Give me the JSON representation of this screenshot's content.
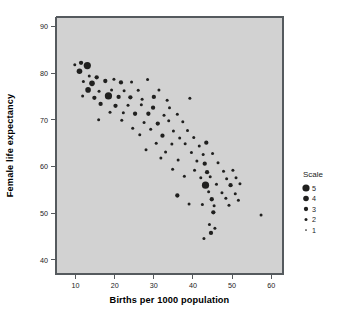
{
  "chart_data": {
    "type": "scatter",
    "title": "",
    "xlabel": "Births per 1000 population",
    "ylabel": "Female life expectancy",
    "xlim": [
      5,
      63
    ],
    "ylim": [
      37,
      92
    ],
    "xticks": [
      10,
      20,
      30,
      40,
      50,
      60
    ],
    "yticks": [
      40,
      50,
      60,
      70,
      80,
      90
    ],
    "xtick_labels": [
      "10",
      "20",
      "30",
      "40",
      "50",
      "60"
    ],
    "ytick_labels": [
      "40",
      "50",
      "60",
      "70",
      "80",
      "90"
    ],
    "grid": false,
    "legend": {
      "title": "Scale",
      "position": "right",
      "entries": [
        {
          "label": "5",
          "size": 5
        },
        {
          "label": "4",
          "size": 4
        },
        {
          "label": "3",
          "size": 3
        },
        {
          "label": "2",
          "size": 2
        },
        {
          "label": "1",
          "size": 1
        }
      ]
    },
    "size_encoding": "Scale",
    "point_color": "#20201f",
    "plot_background": "#d2d2d2",
    "points": [
      {
        "x": 9.8,
        "y": 81.8,
        "s": 2
      },
      {
        "x": 11.4,
        "y": 82.2,
        "s": 3
      },
      {
        "x": 13.0,
        "y": 81.6,
        "s": 5
      },
      {
        "x": 11.0,
        "y": 80.4,
        "s": 4
      },
      {
        "x": 13.5,
        "y": 79.4,
        "s": 2
      },
      {
        "x": 15.4,
        "y": 79.1,
        "s": 3
      },
      {
        "x": 12.0,
        "y": 78.2,
        "s": 2
      },
      {
        "x": 14.2,
        "y": 77.8,
        "s": 4
      },
      {
        "x": 17.6,
        "y": 78.3,
        "s": 3
      },
      {
        "x": 19.8,
        "y": 78.7,
        "s": 2
      },
      {
        "x": 21.6,
        "y": 78.0,
        "s": 3
      },
      {
        "x": 24.3,
        "y": 78.1,
        "s": 2
      },
      {
        "x": 28.4,
        "y": 78.6,
        "s": 2
      },
      {
        "x": 13.2,
        "y": 76.4,
        "s": 4
      },
      {
        "x": 16.0,
        "y": 76.1,
        "s": 2
      },
      {
        "x": 19.2,
        "y": 76.4,
        "s": 2
      },
      {
        "x": 22.4,
        "y": 76.2,
        "s": 2
      },
      {
        "x": 26.0,
        "y": 76.3,
        "s": 2
      },
      {
        "x": 31.3,
        "y": 76.4,
        "s": 2
      },
      {
        "x": 11.8,
        "y": 75.1,
        "s": 2
      },
      {
        "x": 14.8,
        "y": 74.7,
        "s": 3
      },
      {
        "x": 18.4,
        "y": 75.1,
        "s": 5
      },
      {
        "x": 21.0,
        "y": 74.9,
        "s": 3
      },
      {
        "x": 24.0,
        "y": 74.8,
        "s": 3
      },
      {
        "x": 27.0,
        "y": 74.4,
        "s": 2
      },
      {
        "x": 30.0,
        "y": 74.9,
        "s": 3
      },
      {
        "x": 33.4,
        "y": 74.2,
        "s": 2
      },
      {
        "x": 39.2,
        "y": 74.6,
        "s": 2
      },
      {
        "x": 16.4,
        "y": 73.4,
        "s": 3
      },
      {
        "x": 20.2,
        "y": 73.0,
        "s": 3
      },
      {
        "x": 23.4,
        "y": 73.1,
        "s": 2
      },
      {
        "x": 26.8,
        "y": 73.2,
        "s": 2
      },
      {
        "x": 29.8,
        "y": 72.6,
        "s": 3
      },
      {
        "x": 34.0,
        "y": 72.6,
        "s": 2
      },
      {
        "x": 18.8,
        "y": 71.6,
        "s": 2
      },
      {
        "x": 22.2,
        "y": 71.5,
        "s": 2
      },
      {
        "x": 25.2,
        "y": 71.3,
        "s": 3
      },
      {
        "x": 28.6,
        "y": 71.3,
        "s": 3
      },
      {
        "x": 32.6,
        "y": 71.0,
        "s": 2
      },
      {
        "x": 36.0,
        "y": 71.2,
        "s": 2
      },
      {
        "x": 15.9,
        "y": 70.0,
        "s": 2
      },
      {
        "x": 21.8,
        "y": 69.9,
        "s": 2
      },
      {
        "x": 27.5,
        "y": 69.4,
        "s": 2
      },
      {
        "x": 31.0,
        "y": 69.2,
        "s": 3
      },
      {
        "x": 33.8,
        "y": 69.8,
        "s": 2
      },
      {
        "x": 37.4,
        "y": 69.6,
        "s": 2
      },
      {
        "x": 24.6,
        "y": 68.2,
        "s": 2
      },
      {
        "x": 29.2,
        "y": 68.0,
        "s": 2
      },
      {
        "x": 35.0,
        "y": 67.6,
        "s": 2
      },
      {
        "x": 38.6,
        "y": 67.7,
        "s": 2
      },
      {
        "x": 26.4,
        "y": 66.8,
        "s": 2
      },
      {
        "x": 32.2,
        "y": 66.6,
        "s": 3
      },
      {
        "x": 36.6,
        "y": 66.1,
        "s": 2
      },
      {
        "x": 40.2,
        "y": 66.2,
        "s": 2
      },
      {
        "x": 30.6,
        "y": 65.0,
        "s": 2
      },
      {
        "x": 34.6,
        "y": 64.8,
        "s": 2
      },
      {
        "x": 38.0,
        "y": 64.9,
        "s": 2
      },
      {
        "x": 41.6,
        "y": 64.4,
        "s": 2
      },
      {
        "x": 43.4,
        "y": 65.1,
        "s": 3
      },
      {
        "x": 28.0,
        "y": 63.6,
        "s": 2
      },
      {
        "x": 33.0,
        "y": 63.1,
        "s": 2
      },
      {
        "x": 39.6,
        "y": 63.0,
        "s": 2
      },
      {
        "x": 42.6,
        "y": 62.6,
        "s": 2
      },
      {
        "x": 45.0,
        "y": 62.8,
        "s": 2
      },
      {
        "x": 31.8,
        "y": 61.8,
        "s": 2
      },
      {
        "x": 36.2,
        "y": 61.4,
        "s": 2
      },
      {
        "x": 41.0,
        "y": 61.2,
        "s": 2
      },
      {
        "x": 43.0,
        "y": 60.6,
        "s": 3
      },
      {
        "x": 46.4,
        "y": 60.8,
        "s": 2
      },
      {
        "x": 34.8,
        "y": 59.4,
        "s": 2
      },
      {
        "x": 40.4,
        "y": 59.2,
        "s": 2
      },
      {
        "x": 43.6,
        "y": 58.8,
        "s": 3
      },
      {
        "x": 47.8,
        "y": 59.0,
        "s": 2
      },
      {
        "x": 50.2,
        "y": 59.2,
        "s": 2
      },
      {
        "x": 37.8,
        "y": 57.9,
        "s": 2
      },
      {
        "x": 42.0,
        "y": 57.6,
        "s": 2
      },
      {
        "x": 44.4,
        "y": 57.8,
        "s": 2
      },
      {
        "x": 48.6,
        "y": 57.4,
        "s": 2
      },
      {
        "x": 51.0,
        "y": 57.6,
        "s": 2
      },
      {
        "x": 43.2,
        "y": 56.0,
        "s": 5
      },
      {
        "x": 46.0,
        "y": 56.2,
        "s": 2
      },
      {
        "x": 49.6,
        "y": 56.0,
        "s": 3
      },
      {
        "x": 52.0,
        "y": 56.3,
        "s": 2
      },
      {
        "x": 44.0,
        "y": 54.6,
        "s": 2
      },
      {
        "x": 47.4,
        "y": 54.4,
        "s": 2
      },
      {
        "x": 50.8,
        "y": 54.2,
        "s": 2
      },
      {
        "x": 36.0,
        "y": 53.8,
        "s": 3
      },
      {
        "x": 44.8,
        "y": 53.0,
        "s": 3
      },
      {
        "x": 48.4,
        "y": 53.2,
        "s": 2
      },
      {
        "x": 51.6,
        "y": 52.8,
        "s": 2
      },
      {
        "x": 39.0,
        "y": 52.0,
        "s": 2
      },
      {
        "x": 42.4,
        "y": 51.9,
        "s": 2
      },
      {
        "x": 45.4,
        "y": 51.6,
        "s": 2
      },
      {
        "x": 49.2,
        "y": 51.7,
        "s": 2
      },
      {
        "x": 45.2,
        "y": 50.2,
        "s": 3
      },
      {
        "x": 57.4,
        "y": 49.6,
        "s": 2
      },
      {
        "x": 44.2,
        "y": 47.6,
        "s": 2
      },
      {
        "x": 45.6,
        "y": 46.8,
        "s": 2
      },
      {
        "x": 44.6,
        "y": 45.8,
        "s": 3
      },
      {
        "x": 42.8,
        "y": 44.6,
        "s": 2
      }
    ]
  }
}
